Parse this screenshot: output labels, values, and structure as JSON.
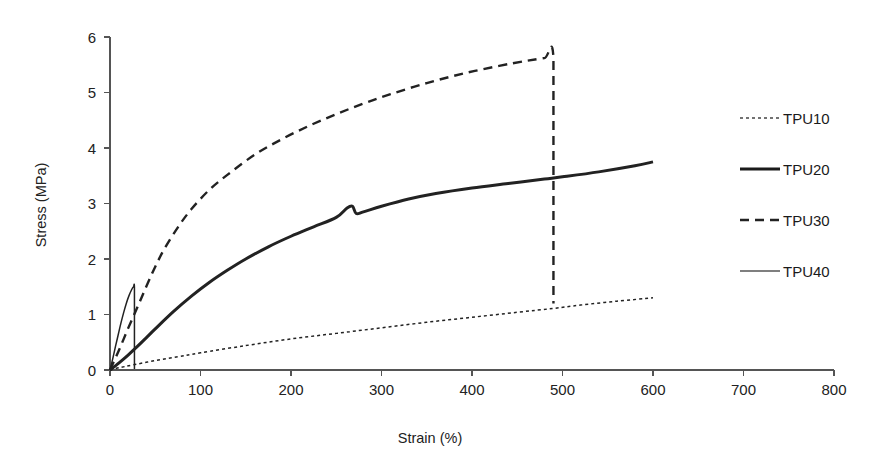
{
  "chart_data": {
    "type": "line",
    "title": "",
    "xlabel": "Strain (%)",
    "ylabel": "Stress (MPa)",
    "xlim": [
      0,
      800
    ],
    "ylim": [
      0,
      6
    ],
    "xticks": [
      0,
      100,
      200,
      300,
      400,
      500,
      600,
      700,
      800
    ],
    "yticks": [
      0,
      1,
      2,
      3,
      4,
      5,
      6
    ],
    "xtick_labels": [
      "0",
      "100",
      "200",
      "300",
      "400",
      "500",
      "600",
      "700",
      "800"
    ],
    "ytick_labels": [
      "0",
      "1",
      "2",
      "3",
      "4",
      "5",
      "6"
    ],
    "grid": false,
    "legend_position": "right",
    "series": [
      {
        "name": "TPU10",
        "style": "fine-dotted",
        "color": "#444444",
        "x": [
          0,
          10,
          25,
          50,
          75,
          100,
          150,
          200,
          250,
          300,
          350,
          400,
          450,
          490,
          520,
          560,
          600
        ],
        "y": [
          0,
          0.04,
          0.09,
          0.17,
          0.24,
          0.31,
          0.44,
          0.56,
          0.66,
          0.76,
          0.86,
          0.95,
          1.04,
          1.11,
          1.17,
          1.24,
          1.3
        ]
      },
      {
        "name": "TPU20",
        "style": "thick-solid",
        "color": "#1a1a1a",
        "x": [
          0,
          10,
          20,
          30,
          40,
          50,
          70,
          90,
          110,
          130,
          150,
          175,
          200,
          225,
          250,
          262,
          268,
          272,
          280,
          300,
          330,
          360,
          400,
          440,
          480,
          500,
          540,
          580,
          600
        ],
        "y": [
          0,
          0.13,
          0.27,
          0.42,
          0.58,
          0.74,
          1.05,
          1.33,
          1.58,
          1.8,
          2.0,
          2.22,
          2.41,
          2.58,
          2.75,
          2.92,
          2.95,
          2.82,
          2.85,
          2.95,
          3.08,
          3.18,
          3.28,
          3.36,
          3.44,
          3.48,
          3.57,
          3.68,
          3.75
        ]
      },
      {
        "name": "TPU30",
        "style": "dashed",
        "color": "#222222",
        "x": [
          0,
          10,
          20,
          30,
          40,
          50,
          60,
          75,
          90,
          110,
          130,
          160,
          190,
          220,
          250,
          280,
          310,
          350,
          390,
          430,
          460,
          480,
          490,
          490,
          490
        ],
        "y": [
          0,
          0.36,
          0.75,
          1.12,
          1.5,
          1.86,
          2.18,
          2.57,
          2.9,
          3.25,
          3.52,
          3.88,
          4.16,
          4.4,
          4.61,
          4.8,
          4.97,
          5.17,
          5.34,
          5.48,
          5.57,
          5.62,
          5.63,
          3.0,
          1.2
        ]
      },
      {
        "name": "TPU40",
        "style": "thin-solid",
        "color": "#555555",
        "x": [
          0,
          3,
          6,
          9,
          12,
          15,
          18,
          21,
          24,
          26,
          27,
          27,
          27
        ],
        "y": [
          0,
          0.2,
          0.42,
          0.63,
          0.84,
          1.03,
          1.2,
          1.34,
          1.45,
          1.5,
          1.49,
          0.8,
          0.02
        ]
      }
    ]
  },
  "legend": {
    "items": [
      {
        "label": "TPU10"
      },
      {
        "label": "TPU20"
      },
      {
        "label": "TPU30"
      },
      {
        "label": "TPU40"
      }
    ]
  }
}
